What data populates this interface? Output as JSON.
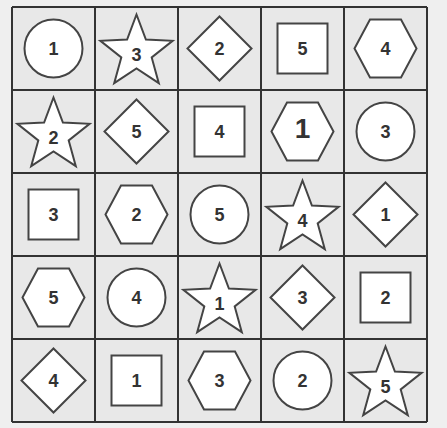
{
  "puzzle": {
    "rows": 5,
    "cols": 5,
    "colors": {
      "background": "#efefef",
      "cell_fill": "#e8e8e8",
      "grid_line": "#333333",
      "shape_fill": "#ffffff",
      "shape_stroke": "#444444",
      "text": "#333333"
    },
    "cells": [
      [
        {
          "shape": "circle",
          "number": "1"
        },
        {
          "shape": "star",
          "number": "3"
        },
        {
          "shape": "diamond",
          "number": "2"
        },
        {
          "shape": "square",
          "number": "5"
        },
        {
          "shape": "hexagon",
          "number": "4"
        }
      ],
      [
        {
          "shape": "star",
          "number": "2"
        },
        {
          "shape": "diamond",
          "number": "5"
        },
        {
          "shape": "square",
          "number": "4"
        },
        {
          "shape": "hexagon",
          "number": "1",
          "emphasis": true
        },
        {
          "shape": "circle",
          "number": "3"
        }
      ],
      [
        {
          "shape": "square",
          "number": "3"
        },
        {
          "shape": "hexagon",
          "number": "2"
        },
        {
          "shape": "circle",
          "number": "5"
        },
        {
          "shape": "star",
          "number": "4"
        },
        {
          "shape": "diamond",
          "number": "1"
        }
      ],
      [
        {
          "shape": "hexagon",
          "number": "5"
        },
        {
          "shape": "circle",
          "number": "4"
        },
        {
          "shape": "star",
          "number": "1"
        },
        {
          "shape": "diamond",
          "number": "3"
        },
        {
          "shape": "square",
          "number": "2"
        }
      ],
      [
        {
          "shape": "diamond",
          "number": "4"
        },
        {
          "shape": "square",
          "number": "1"
        },
        {
          "shape": "hexagon",
          "number": "3"
        },
        {
          "shape": "circle",
          "number": "2"
        },
        {
          "shape": "star",
          "number": "5"
        }
      ]
    ]
  }
}
